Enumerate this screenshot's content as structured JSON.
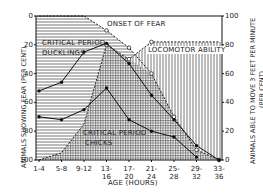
{
  "chart_data": {
    "type": "line",
    "title": "",
    "xlabel": "AGE (HOURS)",
    "ylabel_left": "ANIMALS SHOWING FEAR (PER CENT)",
    "ylabel_right": "ANIMALS ABLE TO MOVE 3 FEET PER MINUTE (PER CENT)",
    "categories": [
      "1-4",
      "5-8",
      "9-12",
      "13-16",
      "17-20",
      "21-24",
      "25-28",
      "29-32",
      "33-36"
    ],
    "ylim_left": [
      0,
      100
    ],
    "ylim_left_inverted": true,
    "yticks_left": [
      0,
      20,
      40,
      60,
      80,
      100
    ],
    "ylim_right": [
      0,
      100
    ],
    "yticks_right": [
      0,
      20,
      40,
      60,
      80,
      100
    ],
    "grid": false,
    "series": [
      {
        "name": "Critical period ducklings",
        "axis": "left",
        "style": "solid-filled-dots",
        "values": [
          52,
          46,
          25,
          19,
          33,
          55,
          72,
          90,
          100
        ]
      },
      {
        "name": "Critical period chicks",
        "axis": "left",
        "style": "solid-filled-dots",
        "values": [
          70,
          72,
          65,
          50,
          72,
          80,
          84,
          98,
          null
        ]
      },
      {
        "name": "Onset of fear",
        "axis": "left",
        "style": "dashed-open-circles",
        "values": [
          0,
          0,
          0,
          10,
          22,
          40,
          70,
          93,
          100
        ]
      },
      {
        "name": "Locomotor ability",
        "axis": "right",
        "style": "dashed-open-circles",
        "values": [
          0,
          5,
          25,
          80,
          70,
          82,
          82,
          82,
          82
        ]
      }
    ],
    "annotations": [
      {
        "text": "ONSET OF FEAR"
      },
      {
        "text": "CRITICAL PERIOD"
      },
      {
        "text": "DUCKLINGS"
      },
      {
        "text": "LOCOMOTOR ABILITY"
      },
      {
        "text": "CRITICAL PERIOD"
      },
      {
        "text": "CHICKS"
      }
    ]
  },
  "labels": {
    "onset": "ONSET OF FEAR",
    "crit_duck_1": "CRITICAL PERIOD",
    "crit_duck_2": "DUCKLINGS",
    "locomotor": "LOCOMOTOR ABILITY",
    "crit_chick_1": "CRITICAL PERIOD",
    "crit_chick_2": "CHICKS",
    "xlabel": "AGE (HOURS)",
    "ylabel_left": "ANIMALS SHOWING FEAR (PER CENT)",
    "ylabel_right_1": "ANIMALS ABLE TO MOVE 3 FEET PER MINUTE",
    "ylabel_right_2": "(PER CENT)"
  }
}
